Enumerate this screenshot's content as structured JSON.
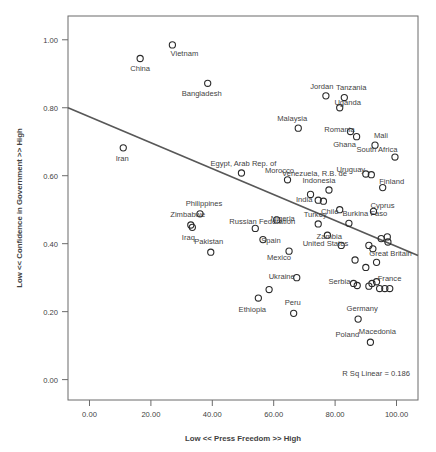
{
  "chart_data": {
    "type": "scatter",
    "title": "",
    "xlabel": "Low << Press Freedom >> High",
    "ylabel": "Low << Confidence in Government >> High",
    "xlim": [
      -7,
      107
    ],
    "ylim": [
      -0.06,
      1.07
    ],
    "xticks": [
      0,
      20,
      40,
      60,
      80,
      100
    ],
    "xticklabels": [
      "0.00",
      "20.00",
      "40.00",
      "60.00",
      "80.00",
      "100.00"
    ],
    "yticks": [
      0.0,
      0.2,
      0.4,
      0.6,
      0.8,
      1.0
    ],
    "yticklabels": [
      "0.00",
      "0.20",
      "0.40",
      "0.60",
      "0.80",
      "1.00"
    ],
    "grid": false,
    "legend": null,
    "annotation": "R Sq Linear = 0.186",
    "fit_line": {
      "type": "linear",
      "x_start": -7,
      "y_start": 0.8,
      "x_end": 107,
      "y_end": 0.365
    },
    "marker_style": "open-circle",
    "points": [
      {
        "label": "Vietnam",
        "x": 27.0,
        "y": 0.985,
        "lx": 12,
        "ly": 11
      },
      {
        "label": "China",
        "x": 16.5,
        "y": 0.945,
        "lx": 0,
        "ly": 13
      },
      {
        "label": "Bangladesh",
        "x": 38.5,
        "y": 0.872,
        "lx": -6,
        "ly": 13
      },
      {
        "label": "Jordan",
        "x": 77.0,
        "y": 0.835,
        "lx": -4,
        "ly": -7
      },
      {
        "label": "Tanzania",
        "x": 83.0,
        "y": 0.83,
        "lx": 7,
        "ly": -8
      },
      {
        "label": "Uganda",
        "x": 81.5,
        "y": 0.8,
        "lx": 8,
        "ly": -3
      },
      {
        "label": "Malaysia",
        "x": 68.0,
        "y": 0.74,
        "lx": -6,
        "ly": -7
      },
      {
        "label": "Romania",
        "x": 85.0,
        "y": 0.73,
        "lx": -11,
        "ly": 0
      },
      {
        "label": "Mali",
        "x": 93.0,
        "y": 0.69,
        "lx": 6,
        "ly": -7
      },
      {
        "label": "Ghana",
        "x": 87.0,
        "y": 0.715,
        "lx": -12,
        "ly": 10
      },
      {
        "label": "South Africa",
        "x": 99.5,
        "y": 0.655,
        "lx": -18,
        "ly": -5
      },
      {
        "label": "Iran",
        "x": 11.0,
        "y": 0.682,
        "lx": -1,
        "ly": 13
      },
      {
        "label": "Egypt, Arab Rep. of",
        "x": 49.5,
        "y": 0.608,
        "lx": 2,
        "ly": -7
      },
      {
        "label": "Morocco",
        "x": 64.5,
        "y": 0.588,
        "lx": -8,
        "ly": -7
      },
      {
        "label": "Venezuela, R.B. de",
        "x": 72.0,
        "y": 0.545,
        "lx": 4,
        "ly": -18
      },
      {
        "label": "Uruguay",
        "x": 90.0,
        "y": 0.605,
        "lx": -15,
        "ly": -2
      },
      {
        "label": "",
        "x": 91.8,
        "y": 0.603,
        "lx": 0,
        "ly": 0
      },
      {
        "label": "Finland",
        "x": 95.5,
        "y": 0.565,
        "lx": 9,
        "ly": -4
      },
      {
        "label": "Indonesia",
        "x": 78.0,
        "y": 0.558,
        "lx": -10,
        "ly": -7
      },
      {
        "label": "India",
        "x": 74.5,
        "y": 0.528,
        "lx": -14,
        "ly": 2
      },
      {
        "label": "",
        "x": 76.2,
        "y": 0.525,
        "lx": 0,
        "ly": 0
      },
      {
        "label": "Chile",
        "x": 81.5,
        "y": 0.5,
        "lx": -10,
        "ly": 4
      },
      {
        "label": "Cyprus",
        "x": 92.5,
        "y": 0.495,
        "lx": 9,
        "ly": -3
      },
      {
        "label": "Zimbabwe",
        "x": 33.0,
        "y": 0.455,
        "lx": -3,
        "ly": -8
      },
      {
        "label": "Philippines",
        "x": 36.0,
        "y": 0.488,
        "lx": 4,
        "ly": -8
      },
      {
        "label": "Iraq",
        "x": 33.5,
        "y": 0.448,
        "lx": -4,
        "ly": 13
      },
      {
        "label": "Pakistan",
        "x": 39.5,
        "y": 0.375,
        "lx": -2,
        "ly": -8
      },
      {
        "label": "Nigeria",
        "x": 61.0,
        "y": 0.47,
        "lx": 6,
        "ly": 1
      },
      {
        "label": "Turkey",
        "x": 74.5,
        "y": 0.458,
        "lx": -3,
        "ly": -7
      },
      {
        "label": "Burkina Faso",
        "x": 84.5,
        "y": 0.46,
        "lx": 16,
        "ly": -7
      },
      {
        "label": "Russian Federation",
        "x": 54.0,
        "y": 0.445,
        "lx": 7,
        "ly": -4
      },
      {
        "label": "Spain",
        "x": 56.5,
        "y": 0.412,
        "lx": 8,
        "ly": 3
      },
      {
        "label": "United States",
        "x": 77.5,
        "y": 0.425,
        "lx": -2,
        "ly": 11
      },
      {
        "label": "Zambia",
        "x": 82.0,
        "y": 0.395,
        "lx": -12,
        "ly": -6
      },
      {
        "label": "",
        "x": 95.0,
        "y": 0.415,
        "lx": 0,
        "ly": 0
      },
      {
        "label": "",
        "x": 97.0,
        "y": 0.42,
        "lx": 0,
        "ly": 0
      },
      {
        "label": "",
        "x": 97.2,
        "y": 0.405,
        "lx": 0,
        "ly": 0
      },
      {
        "label": "",
        "x": 91.0,
        "y": 0.395,
        "lx": 0,
        "ly": 0
      },
      {
        "label": "",
        "x": 92.3,
        "y": 0.385,
        "lx": 0,
        "ly": 0
      },
      {
        "label": "Great Britain",
        "x": 93.5,
        "y": 0.345,
        "lx": 14,
        "ly": -6
      },
      {
        "label": "",
        "x": 90.0,
        "y": 0.33,
        "lx": 0,
        "ly": 0
      },
      {
        "label": "",
        "x": 86.5,
        "y": 0.352,
        "lx": 0,
        "ly": 0
      },
      {
        "label": "Mexico",
        "x": 65.0,
        "y": 0.378,
        "lx": -10,
        "ly": 9
      },
      {
        "label": "Ukraine",
        "x": 67.5,
        "y": 0.3,
        "lx": -15,
        "ly": 1
      },
      {
        "label": "",
        "x": 58.5,
        "y": 0.265,
        "lx": 0,
        "ly": 0
      },
      {
        "label": "Ethiopia",
        "x": 55.0,
        "y": 0.24,
        "lx": -6,
        "ly": 14
      },
      {
        "label": "Serbia",
        "x": 86.0,
        "y": 0.283,
        "lx": -14,
        "ly": 1
      },
      {
        "label": "",
        "x": 87.2,
        "y": 0.277,
        "lx": 0,
        "ly": 0
      },
      {
        "label": "France",
        "x": 93.5,
        "y": 0.288,
        "lx": 13,
        "ly": -1
      },
      {
        "label": "",
        "x": 92.0,
        "y": 0.283,
        "lx": 0,
        "ly": 0
      },
      {
        "label": "",
        "x": 91.0,
        "y": 0.275,
        "lx": 0,
        "ly": 0
      },
      {
        "label": "",
        "x": 94.5,
        "y": 0.268,
        "lx": 0,
        "ly": 0
      },
      {
        "label": "",
        "x": 96.2,
        "y": 0.268,
        "lx": 0,
        "ly": 0
      },
      {
        "label": "",
        "x": 97.8,
        "y": 0.268,
        "lx": 0,
        "ly": 0
      },
      {
        "label": "Peru",
        "x": 66.5,
        "y": 0.195,
        "lx": -1,
        "ly": -8
      },
      {
        "label": "Germany",
        "x": 87.5,
        "y": 0.178,
        "lx": 4,
        "ly": -8
      },
      {
        "label": "Poland",
        "x": 0,
        "y": 0,
        "lx": 0,
        "ly": 0,
        "label_only": true,
        "label_x": 84.0,
        "label_y": 0.125
      },
      {
        "label": "Macedonia",
        "x": 91.5,
        "y": 0.11,
        "lx": 7,
        "ly": -8
      }
    ]
  }
}
